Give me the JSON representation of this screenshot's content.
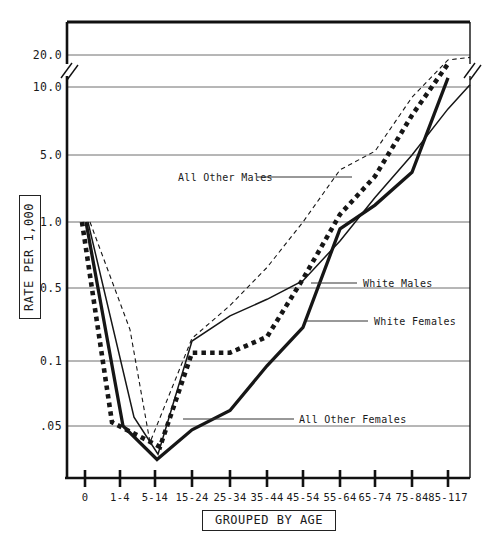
{
  "chart_data": {
    "type": "line",
    "title": "",
    "x_axis": {
      "box_label": "GROUPED BY AGE",
      "categories": [
        "0",
        "1-4",
        "5-14",
        "15-24",
        "25-34",
        "35-44",
        "45-54",
        "55-64",
        "65-74",
        "75-84",
        "85-117"
      ]
    },
    "y_axis": {
      "box_label": "RATE PER 1,000",
      "tick_labels": [
        "20.0",
        "10.0",
        "5.0",
        "1.0",
        "0.5",
        "0.1",
        ".05"
      ],
      "tick_values": [
        20,
        10,
        5,
        1,
        0.5,
        0.1,
        0.05
      ],
      "scale": "pseudo-log, axis break between 10.0 and 20.0",
      "grid": true
    },
    "series": [
      {
        "name": "All Other Males",
        "style": "dashed-thin",
        "values": [
          1.0,
          0.2,
          0.042,
          0.165,
          0.34,
          0.62,
          1.0,
          3.5,
          5.2,
          9.0,
          18.0
        ],
        "edge_extension": {
          "value": 19.0
        }
      },
      {
        "name": "All Other Females",
        "style": "dotted-bold",
        "values": [
          1.0,
          0.052,
          0.04,
          0.12,
          0.12,
          0.17,
          0.55,
          1.2,
          3.0,
          7.5,
          16.5
        ]
      },
      {
        "name": "White Males",
        "style": "solid-thin",
        "values": [
          1.0,
          0.055,
          0.037,
          0.155,
          0.27,
          0.39,
          0.54,
          0.82,
          1.8,
          5.0,
          8.0
        ],
        "edge_extension": {
          "value": 10.5
        }
      },
      {
        "name": "White Females",
        "style": "solid-thick",
        "values": [
          1.0,
          0.05,
          0.035,
          0.048,
          0.059,
          0.095,
          0.21,
          0.93,
          1.5,
          3.3,
          12.2
        ]
      }
    ],
    "annotations": [
      {
        "text": "All Other Males",
        "text_x": 178,
        "y": 177,
        "line_x1": 257,
        "line_x2": 352
      },
      {
        "text": "White Males",
        "text_x": 363,
        "y": 283,
        "line_x1": 311,
        "line_x2": 357
      },
      {
        "text": "White Females",
        "text_x": 374,
        "y": 321,
        "line_x1": 307,
        "line_x2": 368
      },
      {
        "text": "All Other Females",
        "text_x": 299,
        "y": 419,
        "line_x1": 183,
        "line_x2": 294
      }
    ],
    "layout": {
      "plot": {
        "left": 67,
        "top": 22,
        "right": 470,
        "bottom": 478
      },
      "tick_xs": [
        85,
        120,
        155,
        192,
        230,
        267,
        303,
        340,
        375,
        412,
        448
      ],
      "y_anchors": [
        [
          20,
          55
        ],
        [
          10,
          87
        ],
        [
          5,
          155
        ],
        [
          1,
          222
        ],
        [
          0.5,
          288
        ],
        [
          0.1,
          361
        ],
        [
          0.05,
          426
        ]
      ],
      "edge_x": 470,
      "break_y": 70,
      "x_offsets": {
        "All Other Males": [
          5,
          10,
          -5
        ],
        "All Other Females": [
          -3,
          -8,
          5
        ],
        "White Males": [
          3,
          14,
          3
        ],
        "White Females": [
          1,
          3,
          2
        ]
      }
    }
  }
}
